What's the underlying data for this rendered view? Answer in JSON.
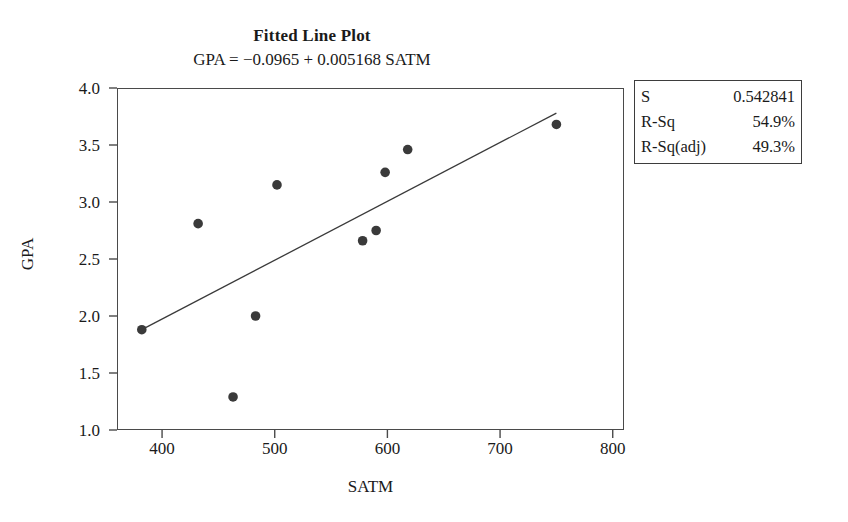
{
  "chart_data": {
    "type": "scatter",
    "title": "Fitted Line Plot",
    "subtitle": "GPA =  −0.0965 + 0.005168 SATM",
    "xlabel": "SATM",
    "ylabel": "GPA",
    "xlim": [
      360,
      810
    ],
    "ylim": [
      1.0,
      4.0
    ],
    "xticks": [
      400,
      500,
      600,
      700,
      800
    ],
    "xtick_labels": [
      "400",
      "500",
      "600",
      "700",
      "800"
    ],
    "yticks": [
      1.0,
      1.5,
      2.0,
      2.5,
      3.0,
      3.5,
      4.0
    ],
    "ytick_labels": [
      "1.0",
      "1.5",
      "2.0",
      "2.5",
      "3.0",
      "3.5",
      "4.0"
    ],
    "grid": false,
    "legend": false,
    "marker_color": "#3a3a3a",
    "line_color": "#3a3a3a",
    "points": [
      {
        "x": 382,
        "y": 1.88
      },
      {
        "x": 432,
        "y": 2.81
      },
      {
        "x": 463,
        "y": 1.29
      },
      {
        "x": 483,
        "y": 2.0
      },
      {
        "x": 502,
        "y": 3.15
      },
      {
        "x": 578,
        "y": 2.66
      },
      {
        "x": 590,
        "y": 2.75
      },
      {
        "x": 598,
        "y": 3.26
      },
      {
        "x": 618,
        "y": 3.46
      },
      {
        "x": 750,
        "y": 3.68
      }
    ],
    "fit_line": {
      "intercept": -0.0965,
      "slope": 0.005168,
      "x_start": 382,
      "x_end": 750,
      "y_start": 1.88,
      "y_end": 3.78
    }
  },
  "stats_box": {
    "rows": [
      {
        "label": "S",
        "value": "0.542841"
      },
      {
        "label": "R-Sq",
        "value": "54.9%"
      },
      {
        "label": "R-Sq(adj)",
        "value": "49.3%"
      }
    ]
  }
}
